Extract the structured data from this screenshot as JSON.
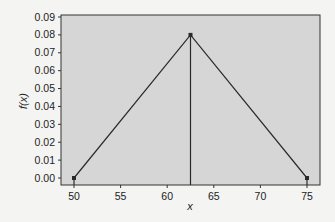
{
  "chart_data": {
    "type": "line",
    "title": "",
    "xlabel": "x",
    "ylabel": "f(x)",
    "xlim": [
      49,
      76
    ],
    "ylim": [
      -0.005,
      0.092
    ],
    "x_ticks": [
      50,
      55,
      60,
      65,
      70,
      75
    ],
    "y_ticks": [
      0.0,
      0.01,
      0.02,
      0.03,
      0.04,
      0.05,
      0.06,
      0.07,
      0.08,
      0.09
    ],
    "grid": false,
    "legend": null,
    "series": [
      {
        "name": "triangular pdf",
        "x": [
          50,
          62.5,
          75
        ],
        "y": [
          0.0,
          0.08,
          0.0
        ]
      }
    ],
    "vertical_lines": [
      {
        "x": 62.5,
        "y_top": 0.08
      }
    ],
    "colors": {
      "plot_bg": "#d6d6d6",
      "line": "#2a2a2a",
      "page_bg": "#f4f4f2"
    }
  }
}
